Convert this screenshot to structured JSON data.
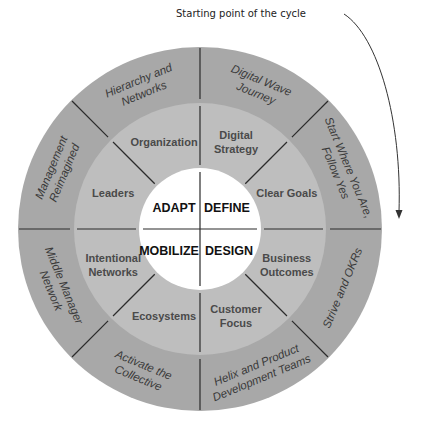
{
  "caption": "Starting point of the cycle",
  "colors": {
    "outer_ring": "#a8a8a8",
    "middle_ring": "#bebebe",
    "core": "#ffffff",
    "divider": "#2b2b2b",
    "arrow": "#333333"
  },
  "core": {
    "quadrants": [
      {
        "label": "DEFINE",
        "position": "top-right"
      },
      {
        "label": "DESIGN",
        "position": "bottom-right"
      },
      {
        "label": "MOBILIZE",
        "position": "bottom-left"
      },
      {
        "label": "ADAPT",
        "position": "top-left"
      }
    ]
  },
  "middle_ring": [
    {
      "lines": [
        "Digital",
        "Strategy"
      ]
    },
    {
      "lines": [
        "Clear Goals"
      ]
    },
    {
      "lines": [
        "Business",
        "Outcomes"
      ]
    },
    {
      "lines": [
        "Customer",
        "Focus"
      ]
    },
    {
      "lines": [
        "Ecosystems"
      ]
    },
    {
      "lines": [
        "Intentional",
        "Networks"
      ]
    },
    {
      "lines": [
        "Leaders"
      ]
    },
    {
      "lines": [
        "Organization"
      ]
    }
  ],
  "outer_ring": [
    {
      "lines": [
        "Digital Wave",
        "Journey"
      ]
    },
    {
      "lines": [
        "Start Where You Are,",
        "Follow Yes"
      ]
    },
    {
      "lines": [
        "Strive and OKRs"
      ]
    },
    {
      "lines": [
        "Helix and Product",
        "Development Teams"
      ]
    },
    {
      "lines": [
        "Activate the",
        "Collective"
      ]
    },
    {
      "lines": [
        "Middle Manager",
        "Network"
      ]
    },
    {
      "lines": [
        "Management",
        "Reimagined"
      ]
    },
    {
      "lines": [
        "Hierarchy and",
        "Networks"
      ]
    }
  ]
}
